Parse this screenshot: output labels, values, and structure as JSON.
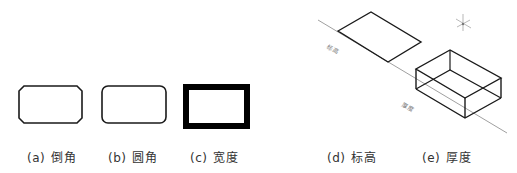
{
  "figures": [
    {
      "id": "a",
      "letter": "(a)",
      "label": "倒角",
      "shape": "chamfered-rectangle"
    },
    {
      "id": "b",
      "letter": "(b)",
      "label": "圆角",
      "shape": "rounded-rectangle"
    },
    {
      "id": "c",
      "letter": "(c)",
      "label": "宽度",
      "shape": "thick-border-rectangle"
    },
    {
      "id": "d",
      "letter": "(d)",
      "label": "标高",
      "shape": "parallelogram-on-plane"
    },
    {
      "id": "e",
      "letter": "(e)",
      "label": "厚度",
      "shape": "isometric-box"
    }
  ],
  "annotations": {
    "elevation_tag": "标高",
    "thickness_tag": "厚度"
  },
  "colors": {
    "stroke": "#1a1a1a",
    "guide_line": "#888888",
    "text": "#333333"
  }
}
